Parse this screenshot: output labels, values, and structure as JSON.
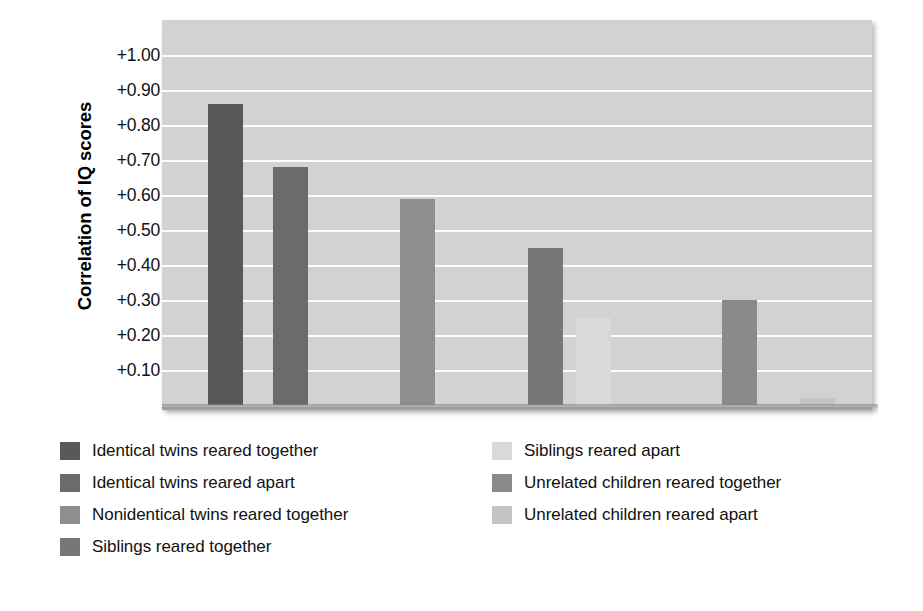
{
  "chart_data": {
    "type": "bar",
    "title": "",
    "xlabel": "",
    "ylabel": "Correlation of IQ scores",
    "ylim": [
      0,
      1.0
    ],
    "grid": true,
    "legend_position": "bottom",
    "ytick_labels": [
      "+1.00",
      "+0.90",
      "+0.80",
      "+0.70",
      "+0.60",
      "+0.50",
      "+0.40",
      "+0.30",
      "+0.20",
      "+0.10"
    ],
    "ytick_values": [
      1.0,
      0.9,
      0.8,
      0.7,
      0.6,
      0.5,
      0.4,
      0.3,
      0.2,
      0.1
    ],
    "categories": [
      "Identical twins reared together",
      "Identical twins reared apart",
      "Nonidentical twins reared together",
      "Siblings reared together",
      "Siblings reared apart",
      "Unrelated children reared together",
      "Unrelated children reared apart"
    ],
    "values": [
      0.86,
      0.68,
      0.59,
      0.45,
      0.25,
      0.3,
      0.02
    ],
    "colors": [
      "#595959",
      "#6b6b6b",
      "#8e8e8e",
      "#777777",
      "#d9d9d9",
      "#8a8a8a",
      "#c4c4c4"
    ],
    "bars": [
      {
        "label": "Identical twins reared together",
        "value": 0.86,
        "color": "#595959",
        "x": 46,
        "width": 35
      },
      {
        "label": "Identical twins reared apart",
        "value": 0.68,
        "color": "#6b6b6b",
        "x": 111,
        "width": 35
      },
      {
        "label": "Nonidentical twins reared together",
        "value": 0.59,
        "color": "#8e8e8e",
        "x": 238,
        "width": 35
      },
      {
        "label": "Siblings reared together",
        "value": 0.45,
        "color": "#777777",
        "x": 366,
        "width": 35
      },
      {
        "label": "Siblings reared apart",
        "value": 0.25,
        "color": "#d9d9d9",
        "x": 414,
        "width": 35
      },
      {
        "label": "Unrelated children reared together",
        "value": 0.3,
        "color": "#8a8a8a",
        "x": 560,
        "width": 35
      },
      {
        "label": "Unrelated children reared apart",
        "value": 0.02,
        "color": "#c4c4c4",
        "x": 638,
        "width": 35
      }
    ]
  },
  "axis": {
    "y_title": "Correlation of IQ scores",
    "ticks": [
      {
        "label": "+1.00",
        "value": 1.0
      },
      {
        "label": "+0.90",
        "value": 0.9
      },
      {
        "label": "+0.80",
        "value": 0.8
      },
      {
        "label": "+0.70",
        "value": 0.7
      },
      {
        "label": "+0.60",
        "value": 0.6
      },
      {
        "label": "+0.50",
        "value": 0.5
      },
      {
        "label": "+0.40",
        "value": 0.4
      },
      {
        "label": "+0.30",
        "value": 0.3
      },
      {
        "label": "+0.20",
        "value": 0.2
      },
      {
        "label": "+0.10",
        "value": 0.1
      }
    ]
  },
  "legend": {
    "left_column": [
      {
        "label": "Identical twins reared together",
        "color": "#595959"
      },
      {
        "label": "Identical twins reared apart",
        "color": "#6b6b6b"
      },
      {
        "label": "Nonidentical twins reared together",
        "color": "#8e8e8e"
      },
      {
        "label": "Siblings reared together",
        "color": "#777777"
      }
    ],
    "right_column": [
      {
        "label": "Siblings reared apart",
        "color": "#d9d9d9"
      },
      {
        "label": "Unrelated children reared together",
        "color": "#8a8a8a"
      },
      {
        "label": "Unrelated children reared apart",
        "color": "#c4c4c4"
      }
    ]
  },
  "theme": {
    "plot_background": "#d2d2d2",
    "gridline_color": "#fdfdfd",
    "page_background": "#ffffff",
    "text_color": "#111111"
  }
}
